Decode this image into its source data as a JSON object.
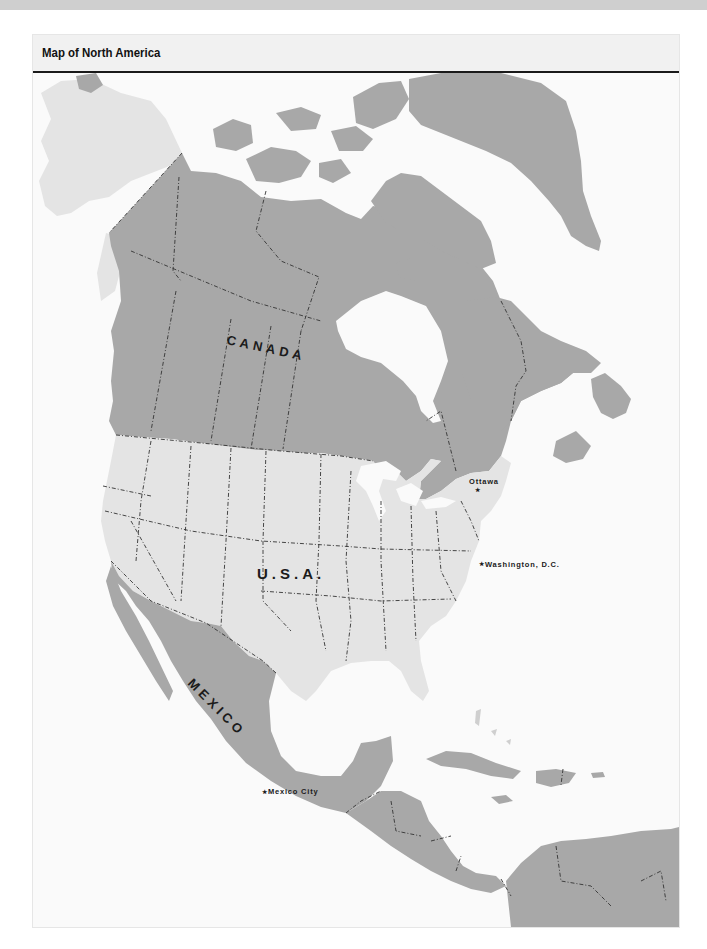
{
  "header": {
    "title": "Map of North America"
  },
  "colors": {
    "page_background": "#ffffff",
    "frame_background": "#f6f6f6",
    "water": "#fafafa",
    "highlighted_country": "#a8a8a8",
    "usa_land": "#e4e4e4",
    "border_line": "#333333",
    "title_rule": "#1a1a1a"
  },
  "map": {
    "country_labels": [
      {
        "id": "canada",
        "label": "CANADA"
      },
      {
        "id": "usa",
        "label": "U.S.A."
      },
      {
        "id": "mexico",
        "label": "MEXICO"
      }
    ],
    "capitals": [
      {
        "id": "ottawa",
        "label": "Ottawa",
        "marker": "★"
      },
      {
        "id": "washington",
        "label": "Washington, D.C.",
        "marker": "★"
      },
      {
        "id": "mexico-city",
        "label": "Mexico City",
        "marker": "★"
      }
    ]
  }
}
